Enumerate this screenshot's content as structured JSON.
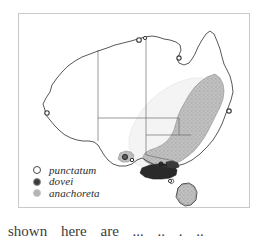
{
  "figure": {
    "kind": "species-distribution-map",
    "region": "Australia",
    "frame_color": "#c9c9c9",
    "background_color": "#ffffff"
  },
  "legend": {
    "items": [
      {
        "label": "punctatum",
        "marker": "open-circle-icon",
        "marker_fill": "#ffffff",
        "marker_stroke": "#4a4a4a"
      },
      {
        "label": "dovei",
        "marker": "filled-circle-icon",
        "marker_fill": "#3c3c3c",
        "marker_stroke": "#8d8d8d"
      },
      {
        "label": "anachoreta",
        "marker": "light-filled-circle-icon",
        "marker_fill": "#b4b4b4",
        "marker_stroke": "#c6c6c6"
      }
    ]
  },
  "map": {
    "coastline_color": "#3a3a3a",
    "state_border_color": "#6e6e6e",
    "ranges": [
      {
        "species": "anachoreta",
        "fill": "#b9b9b9",
        "description": "broad stippled band along the south-east coast from south-east Queensland through New South Wales into Victoria and Tasmania"
      },
      {
        "species": "dovei",
        "fill": "#2a2a2a",
        "description": "dark solid area in southern Victoria / Gippsland"
      },
      {
        "species": "punctatum",
        "fill": "#f2f2f2",
        "description": "pale outer halo inland of the anachoreta band"
      }
    ],
    "point_records": [
      {
        "species": "punctatum",
        "location": "north coast, Northern Territory"
      },
      {
        "species": "punctatum",
        "location": "Gulf of Carpentaria coast"
      },
      {
        "species": "punctatum",
        "location": "south-west Western Australia"
      },
      {
        "species": "dovei",
        "location": "south-east South Australia coast"
      },
      {
        "species": "dovei",
        "location": "southern Victoria coast"
      },
      {
        "species": "punctatum",
        "location": "north-east New South Wales coast"
      },
      {
        "species": "punctatum",
        "location": "Bass Strait island"
      }
    ]
  },
  "caption": {
    "clipped_line": "shown  here  are  ...  ..  . .."
  }
}
